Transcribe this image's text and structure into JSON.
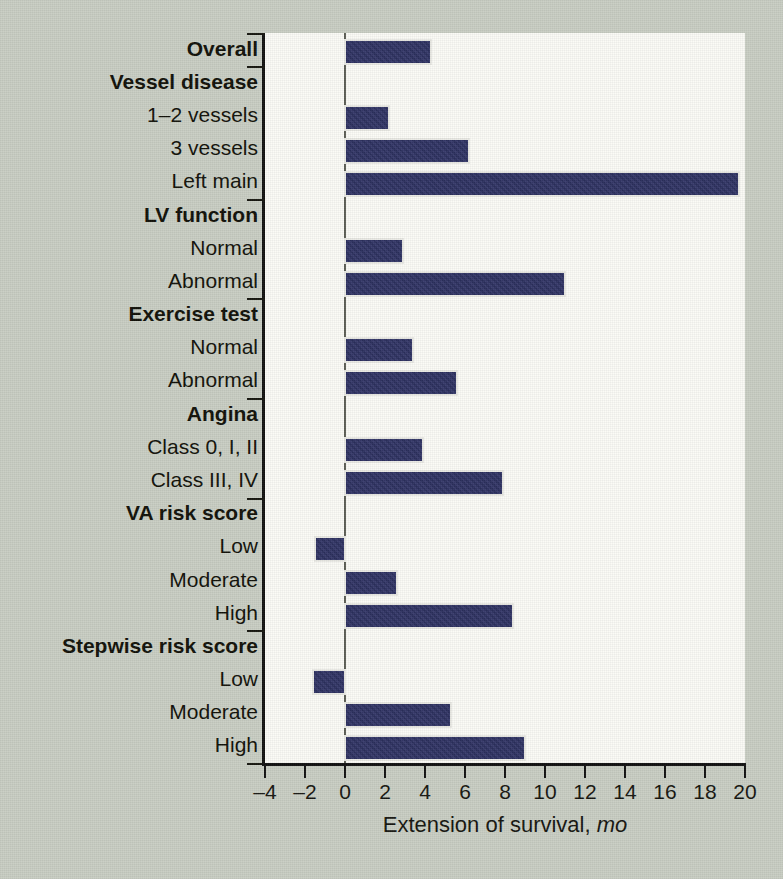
{
  "chart_data": {
    "type": "bar",
    "orientation": "horizontal",
    "title": "",
    "xlabel": "Extension of survival, mo",
    "xlabel_plain": "Extension of survival,",
    "xlabel_unit": "mo",
    "ylabel": "",
    "xlim": [
      -4,
      20
    ],
    "xticks": [
      -4,
      -2,
      0,
      2,
      4,
      6,
      8,
      10,
      12,
      14,
      16,
      18,
      20
    ],
    "xtick_labels": [
      "–4",
      "–2",
      "0",
      "2",
      "4",
      "6",
      "8",
      "10",
      "12",
      "14",
      "16",
      "18",
      "20"
    ],
    "grid": false,
    "legend": false,
    "bar_color": "#2d3163",
    "plot_background": "#fbfbf6",
    "figure_background": "#c9cec3",
    "categories": [
      "Overall",
      "Vessel disease",
      "1–2 vessels",
      "3 vessels",
      "Left main",
      "LV function",
      "Normal",
      "Abnormal",
      "Exercise test",
      "Normal",
      "Abnormal",
      "Angina",
      "Class 0, I, II",
      "Class III, IV",
      "VA risk score",
      "Low",
      "Moderate",
      "High",
      "Stepwise risk score",
      "Low",
      "Moderate",
      "High"
    ],
    "rows": [
      {
        "label": "Overall",
        "is_header": true,
        "value": 4.3
      },
      {
        "label": "Vessel disease",
        "is_header": true,
        "value": null
      },
      {
        "label": "1–2 vessels",
        "is_header": false,
        "value": 2.2
      },
      {
        "label": "3 vessels",
        "is_header": false,
        "value": 6.2
      },
      {
        "label": "Left main",
        "is_header": false,
        "value": 19.7
      },
      {
        "label": "LV function",
        "is_header": true,
        "value": null
      },
      {
        "label": "Normal",
        "is_header": false,
        "value": 2.9
      },
      {
        "label": "Abnormal",
        "is_header": false,
        "value": 11.0
      },
      {
        "label": "Exercise test",
        "is_header": true,
        "value": null
      },
      {
        "label": "Normal",
        "is_header": false,
        "value": 3.4
      },
      {
        "label": "Abnormal",
        "is_header": false,
        "value": 5.6
      },
      {
        "label": "Angina",
        "is_header": true,
        "value": null
      },
      {
        "label": "Class 0, I, II",
        "is_header": false,
        "value": 3.9
      },
      {
        "label": "Class III, IV",
        "is_header": false,
        "value": 7.9
      },
      {
        "label": "VA risk score",
        "is_header": true,
        "value": null
      },
      {
        "label": "Low",
        "is_header": false,
        "value": -1.5
      },
      {
        "label": "Moderate",
        "is_header": false,
        "value": 2.6
      },
      {
        "label": "High",
        "is_header": false,
        "value": 8.4
      },
      {
        "label": "Stepwise risk score",
        "is_header": true,
        "value": null
      },
      {
        "label": "Low",
        "is_header": false,
        "value": -1.6
      },
      {
        "label": "Moderate",
        "is_header": false,
        "value": 5.3
      },
      {
        "label": "High",
        "is_header": false,
        "value": 9.0
      }
    ],
    "values": [
      4.3,
      null,
      2.2,
      6.2,
      19.7,
      null,
      2.9,
      11.0,
      null,
      3.4,
      5.6,
      null,
      3.9,
      7.9,
      null,
      -1.5,
      2.6,
      8.4,
      null,
      -1.6,
      5.3,
      9.0
    ],
    "group_separator_after_rows": [
      0,
      4,
      7,
      10,
      13,
      17,
      21
    ]
  }
}
